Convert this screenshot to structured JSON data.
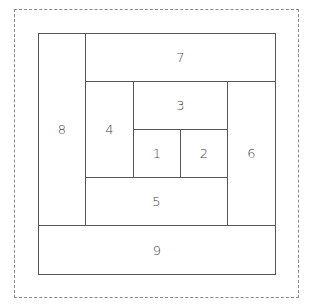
{
  "diagram": {
    "type": "log-cabin-quilt-block",
    "pieces": [
      {
        "label": "1",
        "x": 133,
        "y": 129,
        "w": 48,
        "h": 49
      },
      {
        "label": "2",
        "x": 180,
        "y": 129,
        "w": 48,
        "h": 49
      },
      {
        "label": "3",
        "x": 133,
        "y": 81,
        "w": 95,
        "h": 49
      },
      {
        "label": "4",
        "x": 85,
        "y": 81,
        "w": 49,
        "h": 97
      },
      {
        "label": "5",
        "x": 85,
        "y": 177,
        "w": 143,
        "h": 49
      },
      {
        "label": "6",
        "x": 227,
        "y": 81,
        "w": 49,
        "h": 145
      },
      {
        "label": "7",
        "x": 85,
        "y": 33,
        "w": 191,
        "h": 49
      },
      {
        "label": "8",
        "x": 38,
        "y": 33,
        "w": 48,
        "h": 193
      },
      {
        "label": "9",
        "x": 38,
        "y": 225,
        "w": 238,
        "h": 50
      }
    ]
  }
}
